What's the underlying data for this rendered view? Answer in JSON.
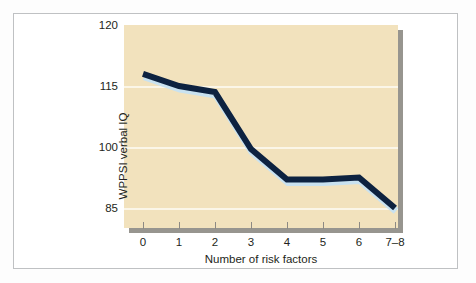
{
  "figure": {
    "background_color": "#ffffff",
    "frame_color": "#bfc1c3",
    "plot_background_color": "#f2e2bd",
    "plot_shadow_color": "#97958f",
    "gridline_color": "#fbf6e8",
    "line_color": "#0d2240",
    "line_highlight_color": "#c9e2f0",
    "axis_tick_color": "#8d8a84"
  },
  "chart_data": {
    "type": "line",
    "title": "",
    "xlabel": "Number of risk factors",
    "ylabel": "WPPSI verbal IQ",
    "categories": [
      "0",
      "1",
      "2",
      "3",
      "4",
      "5",
      "6",
      "7–8"
    ],
    "values": [
      116,
      115,
      113.5,
      99.5,
      92,
      92,
      92.5,
      85
    ],
    "series": [
      {
        "name": "WPPSI verbal IQ",
        "values": [
          116,
          115,
          113.5,
          99.5,
          92,
          92,
          92.5,
          85
        ]
      }
    ],
    "ytick_labels": [
      "120",
      "115",
      "100",
      "85"
    ],
    "ytick_values": [
      120,
      115,
      100,
      85
    ],
    "ylim": [
      80,
      120
    ],
    "grid": true,
    "grid_axis": "y",
    "legend": false,
    "legend_position": "none",
    "markers": false
  }
}
